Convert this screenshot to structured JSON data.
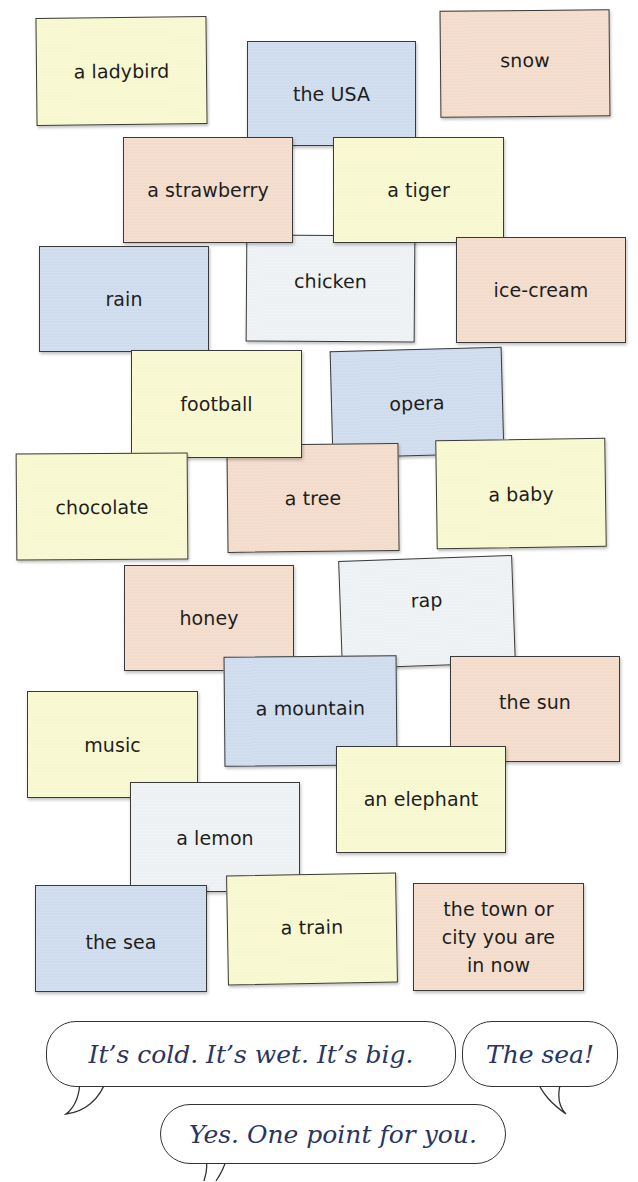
{
  "cards": [
    {
      "label": "a ladybird",
      "color": "#f8f8d0"
    },
    {
      "label": "the USA",
      "color": "#cfdcee"
    },
    {
      "label": "snow",
      "color": "#f3dccb"
    },
    {
      "label": "a strawberry",
      "color": "#f3dccb"
    },
    {
      "label": "a tiger",
      "color": "#f8f8d0"
    },
    {
      "label": "rain",
      "color": "#cfdcee"
    },
    {
      "label": "chicken",
      "color": "#eef1f3"
    },
    {
      "label": "ice-cream",
      "color": "#f3dccb"
    },
    {
      "label": "football",
      "color": "#f8f8d0"
    },
    {
      "label": "opera",
      "color": "#cfdcee"
    },
    {
      "label": "chocolate",
      "color": "#f8f8d0"
    },
    {
      "label": "a tree",
      "color": "#f3dccb"
    },
    {
      "label": "a baby",
      "color": "#f8f8d0"
    },
    {
      "label": "honey",
      "color": "#f3dccb"
    },
    {
      "label": "rap",
      "color": "#eef1f3"
    },
    {
      "label": "a mountain",
      "color": "#cfdcee"
    },
    {
      "label": "the sun",
      "color": "#f3dccb"
    },
    {
      "label": "music",
      "color": "#f8f8d0"
    },
    {
      "label": "an elephant",
      "color": "#f8f8d0"
    },
    {
      "label": "a lemon",
      "color": "#eef1f3"
    },
    {
      "label": "the sea",
      "color": "#cfdcee"
    },
    {
      "label": "a train",
      "color": "#f8f8d0"
    },
    {
      "label": "the town or city you are in now",
      "label_lines": [
        "the town or",
        "city you are",
        "in now"
      ],
      "color": "#f3dccb"
    }
  ],
  "dialogue": {
    "bubble1": "It’s cold. It’s wet. It’s big.",
    "bubble2": "The sea!",
    "bubble3": "Yes. One point for you."
  },
  "colors": {
    "yellow": "#f8f8d0",
    "blue": "#cfdcee",
    "peach": "#f3dccb",
    "grey": "#eef1f3",
    "dialogue_text": "#2a3560"
  }
}
